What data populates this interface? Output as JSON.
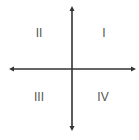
{
  "diagram": {
    "axis_color": "#333333",
    "label_color": "#555555",
    "axes": {
      "horizontal": {
        "y": 69,
        "x_start": 10,
        "x_end": 135,
        "arrows": "both"
      },
      "vertical": {
        "x": 72,
        "y_start": 8,
        "y_end": 130,
        "arrows": "both"
      }
    },
    "quadrants": [
      {
        "id": "q1",
        "label": "I",
        "x": 104,
        "y": 33
      },
      {
        "id": "q2",
        "label": "II",
        "x": 39,
        "y": 33
      },
      {
        "id": "q3",
        "label": "III",
        "x": 39,
        "y": 97
      },
      {
        "id": "q4",
        "label": "IV",
        "x": 103,
        "y": 97
      }
    ]
  }
}
